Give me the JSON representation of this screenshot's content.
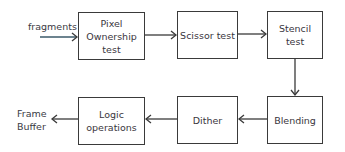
{
  "diagram": {
    "input_label": "fragments",
    "output_label_line1": "Frame",
    "output_label_line2": "Buffer",
    "stages": [
      {
        "id": "pixel-ownership",
        "line1": "Pixel",
        "line2": "Ownership",
        "line3": "test"
      },
      {
        "id": "scissor",
        "line1": "Scissor test"
      },
      {
        "id": "stencil",
        "line1": "Stencil",
        "line2": "test"
      },
      {
        "id": "blending",
        "line1": "Blending"
      },
      {
        "id": "dither",
        "line1": "Dither"
      },
      {
        "id": "logic-operations",
        "line1": "Logic",
        "line2": "operations"
      }
    ],
    "flow": [
      "fragments",
      "Pixel Ownership test",
      "Scissor test",
      "Stencil test",
      "Blending",
      "Dither",
      "Logic operations",
      "Frame Buffer"
    ]
  }
}
